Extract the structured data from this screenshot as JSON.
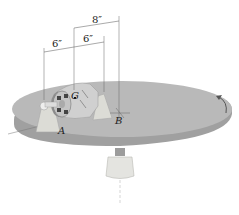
{
  "diagram": {
    "dimensions": [
      {
        "id": "dim-top",
        "label": "8″"
      },
      {
        "id": "dim-left",
        "label": "6″"
      },
      {
        "id": "dim-mid",
        "label": "6″"
      }
    ],
    "points": {
      "G": "G",
      "A": "A",
      "B": "B"
    },
    "colors": {
      "platform": "#b9b9b9",
      "platform_edge": "#9a9a9a",
      "motor": "#d0d0d0",
      "bracket": "#dcdcd6"
    }
  }
}
